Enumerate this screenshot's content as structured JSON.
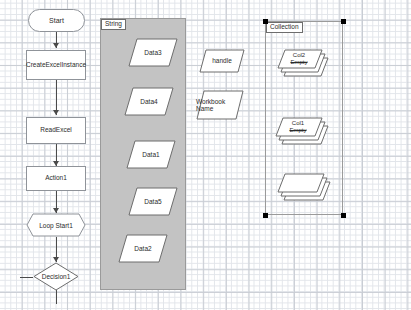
{
  "diagram": {
    "colors": {
      "container_fill": "#c3c3c3",
      "container_border": "#9a9a9a",
      "node_border": "#8f9399",
      "connector": "#4a4a4a",
      "selection_handle": "#000000",
      "grid_major": "#c9cdd4",
      "grid_minor": "#e2e5ea",
      "canvas": "#ffffff"
    },
    "flow_nodes": [
      {
        "id": "start",
        "label": "Start",
        "shape": "terminator"
      },
      {
        "id": "create",
        "label": "CreateExcelInstance",
        "shape": "process"
      },
      {
        "id": "read",
        "label": "ReadExcel",
        "shape": "process"
      },
      {
        "id": "action1",
        "label": "Action1",
        "shape": "process"
      },
      {
        "id": "loop",
        "label": "Loop Start1",
        "shape": "loop"
      },
      {
        "id": "decision",
        "label": "Decision1",
        "shape": "decision"
      }
    ],
    "containers": [
      {
        "id": "string-group",
        "label": "String",
        "selected": false
      },
      {
        "id": "collection-group",
        "label": "Collection",
        "selected": true
      }
    ],
    "string_group_items": [
      {
        "label": "Data3"
      },
      {
        "label": "Data4"
      },
      {
        "label": "Data1"
      },
      {
        "label": "Data5"
      },
      {
        "label": "Data2"
      }
    ],
    "loose_data_items": [
      {
        "label": "handle"
      },
      {
        "label": "Workbook Name"
      }
    ],
    "collection_items": [
      {
        "label": "Col2",
        "sublabel": "Empty"
      },
      {
        "label": "Col1",
        "sublabel": "Empty"
      },
      {
        "label": "",
        "sublabel": ""
      }
    ]
  }
}
